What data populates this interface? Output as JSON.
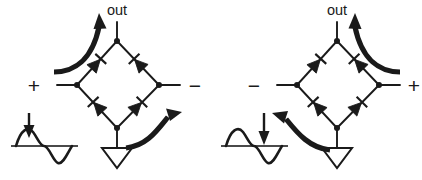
{
  "figure": {
    "background_color": "#ffffff",
    "line_color": "#1a1a1a",
    "axis_color": "#4a4a4a"
  },
  "panels": [
    {
      "id": "left",
      "name": "positive-half-cycle",
      "labels": {
        "out": "out",
        "left_terminal": "+",
        "right_terminal": "−"
      },
      "bridge": {
        "diode_count": 4,
        "diodes": [
          {
            "name": "diode-top-left",
            "conducting": true
          },
          {
            "name": "diode-top-right",
            "conducting": false
          },
          {
            "name": "diode-bottom-left",
            "conducting": false
          },
          {
            "name": "diode-bottom-right",
            "conducting": true
          }
        ],
        "node_count": 4
      },
      "current_arrows": [
        {
          "name": "current-arrow-out",
          "direction": "up",
          "position": "top-left"
        },
        {
          "name": "current-arrow-return",
          "direction": "right",
          "position": "bottom-right"
        }
      ],
      "waveform": {
        "name": "input-waveform-positive",
        "marker": "down-arrow",
        "marker_target": "positive-peak",
        "cycles": 1
      },
      "ground": {
        "name": "ground-symbol",
        "style": "hollow-triangle"
      }
    },
    {
      "id": "right",
      "name": "negative-half-cycle",
      "labels": {
        "out": "out",
        "left_terminal": "−",
        "right_terminal": "+"
      },
      "bridge": {
        "diode_count": 4,
        "diodes": [
          {
            "name": "diode-top-left",
            "conducting": false
          },
          {
            "name": "diode-top-right",
            "conducting": true
          },
          {
            "name": "diode-bottom-left",
            "conducting": true
          },
          {
            "name": "diode-bottom-right",
            "conducting": false
          }
        ],
        "node_count": 4
      },
      "current_arrows": [
        {
          "name": "current-arrow-out",
          "direction": "up",
          "position": "top-right"
        },
        {
          "name": "current-arrow-return",
          "direction": "left",
          "position": "bottom-left"
        }
      ],
      "waveform": {
        "name": "input-waveform-negative",
        "marker": "down-arrow",
        "marker_target": "negative-trough",
        "cycles": 1
      },
      "ground": {
        "name": "ground-symbol",
        "style": "hollow-triangle"
      }
    }
  ]
}
